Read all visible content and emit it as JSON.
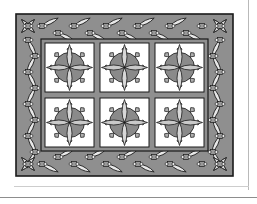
{
  "figure": {
    "kind": "quilt-pattern-diagram",
    "title": "",
    "caption": ""
  },
  "colors": {
    "background": "#ffffff",
    "border_fill": "#8f8f8f",
    "sashing_fill": "#8f8f8f",
    "block_fill": "#ffffff",
    "outline": "#1a1a1a",
    "motif_circle_fill": "#8a8a8a",
    "motif_petal_light": "#d8d8d8",
    "motif_petal_mid": "#b4b4b4",
    "motif_spike_fill": "#b0b0b0",
    "border_petal_fill": "#e8e8e8",
    "node_fill": "#9a9a9a",
    "page_rule": "#8d8d8d"
  },
  "quilt": {
    "outer_frame": {
      "x": 1,
      "y": 1,
      "width": 217,
      "height": 162,
      "stroke_width": 1.4
    },
    "border_band_width": 26,
    "inner_field": {
      "x": 27,
      "y": 27,
      "width": 165,
      "height": 110
    },
    "grid": {
      "columns": 3,
      "rows": 2,
      "total_blocks": 6,
      "sashing_width": 6,
      "block_width": 49,
      "block_height": 49
    },
    "blocks": [
      {
        "id": "block-r1c1",
        "row": 1,
        "col": 1,
        "motif": "eight-point-star-compass"
      },
      {
        "id": "block-r1c2",
        "row": 1,
        "col": 2,
        "motif": "eight-point-star-compass"
      },
      {
        "id": "block-r1c3",
        "row": 1,
        "col": 3,
        "motif": "eight-point-star-compass"
      },
      {
        "id": "block-r2c1",
        "row": 2,
        "col": 1,
        "motif": "eight-point-star-compass"
      },
      {
        "id": "block-r2c2",
        "row": 2,
        "col": 2,
        "motif": "eight-point-star-compass"
      },
      {
        "id": "block-r2c3",
        "row": 2,
        "col": 3,
        "motif": "eight-point-star-compass"
      }
    ],
    "block_motif": {
      "name": "eight-point-star-compass",
      "circle_radius": 15,
      "spike_count": 8,
      "spike_length": 5,
      "petal_count": 4,
      "petal_length": 23,
      "petal_half_width": 5
    },
    "border_motif": {
      "name": "chained-petal-zigzag",
      "petals_top": 12,
      "petals_bottom": 12,
      "petals_left": 8,
      "petals_right": 8,
      "node_shape": "square-with-circles",
      "corner_motif": "four-petal-diagonal-burst"
    }
  }
}
